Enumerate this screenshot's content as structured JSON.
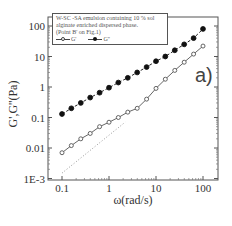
{
  "chart_data": {
    "type": "line",
    "title": "",
    "panel_label": "a)",
    "legend": {
      "description_lines": [
        "W-SC -SA emulsion containing 10 % sol",
        "alginate enriched dispersed phase.",
        "(Point B' on Fig.1)"
      ],
      "entries": [
        {
          "label": "G'",
          "marker": "open-circle"
        },
        {
          "label": "G''",
          "marker": "filled-circle"
        }
      ],
      "position": "top-left"
    },
    "xlabel": "ω(rad/s)",
    "ylabel": "G',G''(Pa)",
    "xscale": "log",
    "yscale": "log",
    "xlim": [
      0.07,
      150
    ],
    "ylim": [
      0.001,
      200
    ],
    "xticks": [
      "0.1",
      "1",
      "10",
      "100"
    ],
    "yticks": [
      "1E-3",
      "0.01",
      "0.1",
      "1",
      "10",
      "100"
    ],
    "grid": false,
    "x": [
      0.1,
      0.158,
      0.251,
      0.398,
      0.631,
      1,
      1.58,
      2.51,
      3.98,
      6.31,
      10,
      15.8,
      25.1,
      39.8,
      63.1,
      100
    ],
    "series": [
      {
        "name": "G'",
        "marker": "open-circle",
        "values": [
          0.007,
          0.012,
          0.02,
          0.03,
          0.05,
          0.07,
          0.1,
          0.15,
          0.2,
          0.4,
          0.9,
          1.8,
          3.5,
          6.5,
          12,
          22
        ]
      },
      {
        "name": "G''",
        "marker": "filled-circle",
        "values": [
          0.13,
          0.2,
          0.3,
          0.45,
          0.65,
          0.95,
          1.4,
          2,
          3,
          4.5,
          7,
          10,
          16,
          25,
          40,
          80
        ]
      }
    ],
    "reference_line": {
      "style": "dotted",
      "slope": 1,
      "from": [
        0.1,
        0.0015
      ],
      "to": [
        2.2,
        0.07
      ]
    }
  }
}
